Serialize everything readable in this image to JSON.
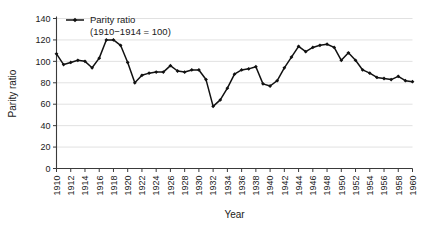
{
  "chart_data": {
    "type": "line",
    "title": "",
    "xlabel": "Year",
    "ylabel": "Parity ratio",
    "legend": {
      "position": "top-left",
      "entries": [
        {
          "name": "Parity ratio",
          "sublabel": "(1910−1914 = 100)",
          "color": "#111111",
          "marker": "diamond"
        }
      ]
    },
    "xlim": [
      1910,
      1960
    ],
    "ylim": [
      0,
      140
    ],
    "ytick_step": 20,
    "xtick_step": 2,
    "grid": "horizontal",
    "yticks": [
      0,
      20,
      40,
      60,
      80,
      100,
      120,
      140
    ],
    "xticks": [
      "1910",
      "1912",
      "1914",
      "1916",
      "1918",
      "1920",
      "1922",
      "1924",
      "1926",
      "1928",
      "1930",
      "1932",
      "1934",
      "1936",
      "1938",
      "1940",
      "1942",
      "1944",
      "1946",
      "1948",
      "1950",
      "1952",
      "1954",
      "1956",
      "1958",
      "1960"
    ],
    "x": [
      1910,
      1911,
      1912,
      1913,
      1914,
      1915,
      1916,
      1917,
      1918,
      1919,
      1920,
      1921,
      1922,
      1923,
      1924,
      1925,
      1926,
      1927,
      1928,
      1929,
      1930,
      1931,
      1932,
      1933,
      1934,
      1935,
      1936,
      1937,
      1938,
      1939,
      1940,
      1941,
      1942,
      1943,
      1944,
      1945,
      1946,
      1947,
      1948,
      1949,
      1950,
      1951,
      1952,
      1953,
      1954,
      1955,
      1956,
      1957,
      1958,
      1959,
      1960
    ],
    "series": [
      {
        "name": "Parity ratio",
        "values": [
          107,
          97,
          99,
          101,
          100,
          94,
          103,
          120,
          120,
          115,
          99,
          80,
          87,
          89,
          90,
          90,
          96,
          91,
          90,
          92,
          92,
          83,
          58,
          64,
          75,
          88,
          92,
          93,
          95,
          79,
          77,
          82,
          94,
          104,
          114,
          109,
          113,
          115,
          116,
          113,
          101,
          108,
          101,
          92,
          89,
          85,
          84,
          83,
          86,
          82,
          81
        ]
      }
    ]
  }
}
